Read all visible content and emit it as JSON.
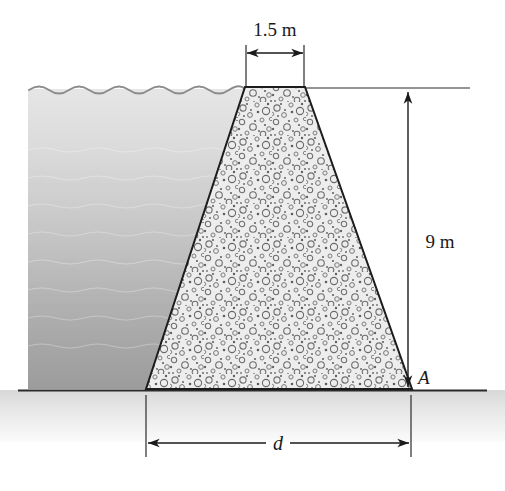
{
  "figure": {
    "labels": {
      "crest_width": "1.5 m",
      "height": "9 m",
      "base_width": "d",
      "toe_point": "A"
    },
    "parts": {
      "water_label": "water-reservoir",
      "dam_label": "concrete-dam",
      "ground_label": "ground-line"
    },
    "colors": {
      "water_top": "#e3e3e3",
      "water_bottom": "#9d9d9d",
      "concrete_fill": "#ebebeb",
      "aggregate": "#6e6e6e",
      "ground": "#e8e8e8",
      "outline": "#1a1a1a"
    },
    "geometry": {
      "dam_top_left_x": 245,
      "dam_top_right_x": 305,
      "dam_top_y": 87,
      "dam_base_left_x": 146,
      "dam_base_right_x": 412,
      "ground_y": 390,
      "water_left_x": 28,
      "water_surface_y": 89
    }
  }
}
